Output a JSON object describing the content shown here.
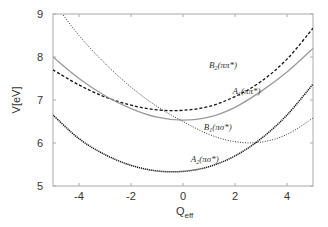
{
  "chart_data": {
    "type": "line",
    "title": "",
    "xlabel": "Q",
    "xlabel_sub": "eff",
    "ylabel": "V[eV]",
    "xlim": [
      -5,
      5
    ],
    "ylim": [
      5,
      9
    ],
    "xticks": [
      -4,
      -2,
      0,
      2,
      4
    ],
    "yticks": [
      5,
      6,
      7,
      8,
      9
    ],
    "grid": false,
    "legend": "inline labels",
    "series": [
      {
        "name": "B2(ππ*)",
        "label_main": "B",
        "label_sub": "2",
        "label_rest": "(ππ*)",
        "style": "dashed",
        "color": "#111111",
        "x": [
          -5,
          -4,
          -3,
          -2,
          -1,
          0,
          1,
          2,
          3,
          4,
          5
        ],
        "y": [
          7.7,
          7.35,
          7.07,
          6.88,
          6.77,
          6.76,
          6.85,
          7.08,
          7.43,
          7.95,
          8.67
        ]
      },
      {
        "name": "A1(ππ*)",
        "label_main": "A",
        "label_sub": "1",
        "label_rest": "(ππ*)",
        "style": "solid",
        "color": "#9a9a9a",
        "x": [
          -5,
          -4,
          -3,
          -2,
          -1,
          0,
          1,
          2,
          3,
          4,
          5
        ],
        "y": [
          8.0,
          7.5,
          7.1,
          6.8,
          6.6,
          6.53,
          6.6,
          6.83,
          7.2,
          7.65,
          8.2
        ]
      },
      {
        "name": "B1(πσ*)",
        "label_main": "B",
        "label_sub": "1",
        "label_rest": "(πσ*)",
        "style": "dotted",
        "color": "#333333",
        "x": [
          -5,
          -4,
          -3,
          -2,
          -1,
          0,
          1,
          2,
          3,
          4,
          5
        ],
        "y": [
          9.3,
          8.5,
          7.85,
          7.3,
          6.85,
          6.5,
          6.2,
          6.03,
          6.02,
          6.2,
          6.58
        ]
      },
      {
        "name": "A2(πσ*)",
        "label_main": "A",
        "label_sub": "2",
        "label_rest": "(πσ*)",
        "style": "dense-dotted",
        "color": "#111111",
        "x": [
          -5,
          -4,
          -3,
          -2,
          -1,
          0,
          1,
          2,
          3,
          4,
          5
        ],
        "y": [
          6.65,
          6.1,
          5.73,
          5.48,
          5.35,
          5.34,
          5.45,
          5.7,
          6.1,
          6.65,
          7.37
        ]
      }
    ],
    "annotations": [
      {
        "text": "B2(ππ*)",
        "x": 1.0,
        "y": 7.75
      },
      {
        "text": "A1(ππ*)",
        "x": 1.9,
        "y": 7.15
      },
      {
        "text": "B1(πσ*)",
        "x": 0.8,
        "y": 6.3
      },
      {
        "text": "A2(πσ*)",
        "x": 0.3,
        "y": 5.55
      }
    ]
  }
}
